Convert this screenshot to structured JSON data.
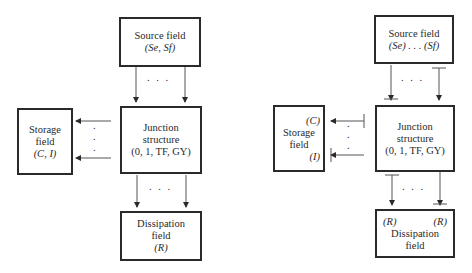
{
  "left_diagram": {
    "source": {
      "line1": "Source field",
      "line2": "(Se, Sf)"
    },
    "junction": {
      "line1": "Junction",
      "line2": "structure",
      "line3": "(0, 1, TF, GY)"
    },
    "storage": {
      "line1": "Storage",
      "line2": "field",
      "line3": "(C, I)"
    },
    "dissipation": {
      "line1": "Dissipation",
      "line2": "field",
      "line3": "(R)"
    },
    "dots_h": ". . .",
    "dots_v": "."
  },
  "right_diagram": {
    "source": {
      "line1": "Source field",
      "line2": "(Se) . . . (Sf)"
    },
    "junction": {
      "line1": "Junction",
      "line2": "structure",
      "line3": "(0, 1, TF, GY)"
    },
    "storage": {
      "label_c": "(C)",
      "line1": "Storage",
      "line2": "field",
      "label_i": "(I)"
    },
    "dissipation": {
      "label_r_left": "(R)",
      "label_r_right": "(R)",
      "line1": "Dissipation",
      "line2": "field"
    },
    "dots_h": ". . .",
    "dots_v": "."
  },
  "colors": {
    "stroke": "#2a2a2a",
    "background": "#ffffff"
  }
}
